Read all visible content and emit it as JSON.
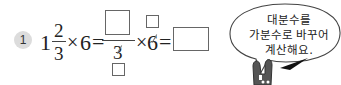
{
  "problem": {
    "number": "1",
    "whole": "1",
    "numerator": "2",
    "denominator": "3",
    "times": "×",
    "multiplier": "6",
    "equals": "=",
    "step_denominator": "3",
    "step_multiplier": "6",
    "answer_boxes": [
      {
        "name": "improper-numerator-box"
      },
      {
        "name": "cancel-denominator-box"
      },
      {
        "name": "cancel-multiplier-box"
      },
      {
        "name": "final-answer-box"
      }
    ]
  },
  "speech_bubble": {
    "lines": [
      "대분수를",
      "가분수로 바꾸어",
      "계산해요."
    ]
  },
  "character": {
    "type": "rabbit",
    "icon": "rabbit-icon"
  }
}
